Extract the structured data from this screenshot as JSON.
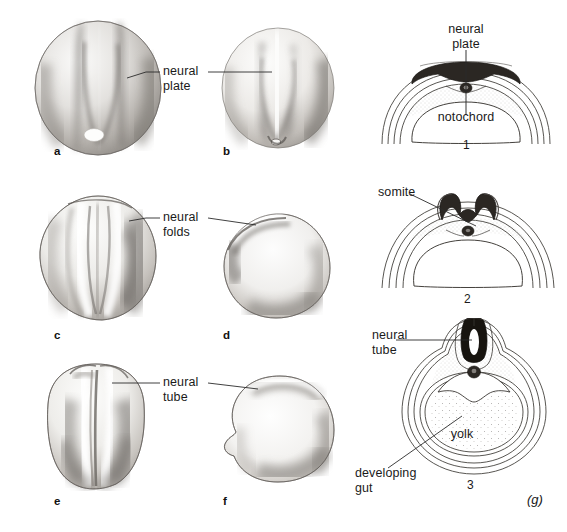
{
  "figure": {
    "tag": "(g)",
    "background_color": "#ffffff",
    "ink_color": "#1a1a1a"
  },
  "photo_panels": [
    {
      "letter": "a",
      "view": "dorsal view of neurula showing flat neural plate and yolk plug",
      "letter_x": 54,
      "letter_y": 151,
      "cx": 96,
      "cy": 88,
      "rx": 63,
      "ry": 67
    },
    {
      "letter": "b",
      "view": "dorsal view, neural plate narrowing",
      "letter_x": 223,
      "letter_y": 151,
      "cx": 277,
      "cy": 88,
      "rx": 56,
      "ry": 60
    },
    {
      "letter": "c",
      "view": "dorsal view showing raised neural folds",
      "letter_x": 54,
      "letter_y": 335,
      "cx": 98,
      "cy": 257,
      "rx": 57,
      "ry": 62
    },
    {
      "letter": "d",
      "view": "lateral view showing neural folds",
      "letter_x": 223,
      "letter_y": 335,
      "cx": 272,
      "cy": 263,
      "rx": 55,
      "ry": 53
    },
    {
      "letter": "e",
      "view": "dorsal view showing closing neural tube",
      "letter_x": 54,
      "letter_y": 501,
      "cx": 94,
      "cy": 425,
      "rx": 52,
      "ry": 62
    },
    {
      "letter": "f",
      "view": "lateral view showing closed neural tube",
      "letter_x": 223,
      "letter_y": 501,
      "cx": 277,
      "cy": 427,
      "rx": 56,
      "ry": 55
    }
  ],
  "photo_labels": [
    {
      "id": "neural-plate",
      "text": "neural\nplate",
      "x": 163,
      "y": 62,
      "left_leader": {
        "x1": 159,
        "y1": 72,
        "x2": 145,
        "y2": 72,
        "x3": 128,
        "y3": 78
      },
      "right_leader": {
        "x1": 207,
        "y1": 72,
        "x2": 268,
        "y2": 72
      }
    },
    {
      "id": "neural-folds",
      "text": "neural\nfolds",
      "x": 163,
      "y": 207,
      "left_leader": {
        "x1": 159,
        "y1": 218,
        "x2": 145,
        "y2": 218,
        "x3": 128,
        "y3": 220
      },
      "right_leader": {
        "x1": 207,
        "y1": 218,
        "x2": 252,
        "y2": 222
      }
    },
    {
      "id": "neural-tube",
      "text": "neural\ntube",
      "x": 163,
      "y": 373,
      "left_leader": {
        "x1": 159,
        "y1": 383,
        "x2": 145,
        "y2": 383,
        "x3": 115,
        "y3": 383
      },
      "right_leader": {
        "x1": 207,
        "y1": 383,
        "x2": 253,
        "y2": 388
      }
    }
  ],
  "section_panels": [
    {
      "number": "1",
      "number_x": 470,
      "number_y": 142,
      "stage": "neural plate stage cross section",
      "labels": [
        {
          "id": "neural-plate-section",
          "text": "neural\nplate",
          "x": 438,
          "y": 26,
          "align": "center"
        },
        {
          "id": "notochord",
          "text": "notochord",
          "x": 438,
          "y": 112,
          "align": "center"
        }
      ]
    },
    {
      "number": "2",
      "number_x": 470,
      "number_y": 297,
      "stage": "neural fold stage cross section with somites",
      "labels": [
        {
          "id": "somite",
          "text": "somite",
          "x": 380,
          "y": 186,
          "align": "left"
        }
      ]
    },
    {
      "number": "3",
      "number_x": 470,
      "number_y": 484,
      "stage": "neural tube stage cross section with yolk and gut",
      "labels": [
        {
          "id": "neural-tube-section",
          "text": "neural\ntube",
          "x": 372,
          "y": 325,
          "align": "left"
        },
        {
          "id": "yolk",
          "text": "yolk",
          "x": 455,
          "y": 434,
          "align": "center"
        },
        {
          "id": "developing-gut",
          "text": "developing\ngut",
          "x": 355,
          "y": 467,
          "align": "left"
        }
      ]
    }
  ],
  "colors": {
    "neural_ectoderm_dark": "#2b2723",
    "outline": "#33302c",
    "stipple": "#6d6a66",
    "embryo_mid": "#9b9792",
    "embryo_light": "#f2f1ef"
  }
}
